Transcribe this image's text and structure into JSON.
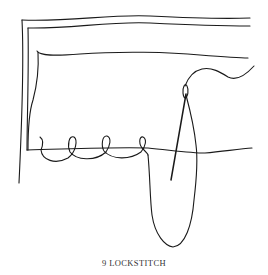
{
  "figure": {
    "number": "9",
    "title": "LOCKSTITCH",
    "caption": "9 LOCKSTITCH",
    "elements": [
      "fabric-fold-outer",
      "fabric-fold-inner",
      "hem-edge",
      "seam-line",
      "stitch-loops",
      "needle",
      "thread"
    ],
    "stitch_loop_count": 4,
    "line_color": "#1a1a1a",
    "background_color": "#ffffff"
  }
}
